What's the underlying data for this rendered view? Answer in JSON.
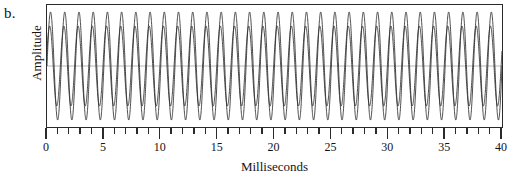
{
  "panel": {
    "label": "b."
  },
  "chart_data": {
    "type": "line",
    "title": "",
    "subtitle": "",
    "xlabel": "Milliseconds",
    "ylabel": "Amplitude",
    "xlim": [
      0,
      40
    ],
    "ylim": [
      -1.05,
      1.05
    ],
    "grid": false,
    "legend": null,
    "x_major_ticks": [
      0,
      5,
      10,
      15,
      20,
      25,
      30,
      35,
      40
    ],
    "x_minor_tick_interval": 1,
    "x_tick_labels": [
      "0",
      "5",
      "10",
      "15",
      "20",
      "25",
      "30",
      "35",
      "40"
    ],
    "y_axis_ticks_shown": false,
    "y_tick_labels": [],
    "centerline_value": 0,
    "waveform_color": "#2a2a2a",
    "centerline_color": "#b9b9b9",
    "frame_color": "#2a2a2a",
    "background_color": "#ffffff",
    "series": [
      {
        "name": "Sine wave 1",
        "frequency_hz": 800,
        "amplitude": 1.0,
        "phase_deg": 0,
        "cycles_shown": 32
      },
      {
        "name": "Sine wave 2",
        "frequency_hz": 800,
        "amplitude": 0.74,
        "phase_deg": 22,
        "cycles_shown": 32
      }
    ]
  }
}
